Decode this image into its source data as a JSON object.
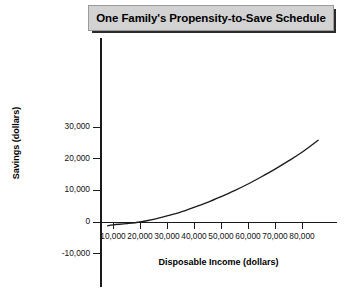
{
  "title": {
    "text": "One Family's Propensity-to-Save Schedule"
  },
  "chart_data": {
    "type": "line",
    "title": "One Family's Propensity-to-Save Schedule",
    "xlabel": "Disposable Income (dollars)",
    "ylabel": "Savings (dollars)",
    "xlim": [
      0,
      87000
    ],
    "ylim": [
      -13000,
      38000
    ],
    "grid": false,
    "legend": null,
    "x_ticks": [
      10000,
      20000,
      30000,
      40000,
      50000,
      60000,
      70000,
      80000
    ],
    "x_tick_labels": [
      "10,000",
      "20,000",
      "30,000",
      "40,000",
      "50,000",
      "60,000",
      "70,000",
      "80,000"
    ],
    "y_ticks": [
      30000,
      20000,
      10000,
      0,
      -10000
    ],
    "y_tick_labels": [
      "30,000",
      "20,000",
      "10,000",
      "0",
      "-10,000"
    ],
    "series": [
      {
        "name": "Savings schedule",
        "color": "#1a1a1a",
        "x": [
          8000,
          10000,
          15000,
          20000,
          25000,
          30000,
          35000,
          40000,
          45000,
          50000,
          55000,
          60000,
          65000,
          70000,
          75000,
          80000,
          86000
        ],
        "values": [
          -1200,
          -900,
          -500,
          0,
          800,
          1900,
          3100,
          4600,
          6200,
          8000,
          9900,
          12000,
          14300,
          16700,
          19300,
          22000,
          25800
        ]
      }
    ],
    "annotations": []
  },
  "axes": {
    "y_title": "Savings (dollars)",
    "x_title": "Disposable Income (dollars)"
  }
}
